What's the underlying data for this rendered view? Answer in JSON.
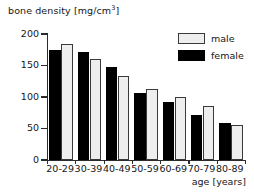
{
  "chart_data": {
    "type": "bar",
    "title": "",
    "xlabel": "age [years]",
    "ylabel": "bone density [mg/cm",
    "ylabel_sup": "3",
    "ylabel_tail": "]",
    "ylabel_full": "bone density [mg/cm3]",
    "categories": [
      "20-29",
      "30-39",
      "40-49",
      "50-59",
      "60-69",
      "70-79",
      "80-89"
    ],
    "series": [
      {
        "name": "female",
        "color": "#000000",
        "values": [
          175,
          172,
          147,
          106,
          92,
          71,
          59
        ]
      },
      {
        "name": "male",
        "color": "#eeeeee",
        "values": [
          184,
          161,
          133,
          113,
          100,
          85,
          56
        ]
      }
    ],
    "yticks": [
      0,
      50,
      100,
      150,
      200
    ],
    "ylim": [
      0,
      200
    ],
    "grid": false,
    "legend_position": "top-right",
    "legend_entries": [
      "male",
      "female"
    ]
  },
  "legend": {
    "male_label": "male",
    "female_label": "female"
  },
  "axis": {
    "y_title_main": "bone density [mg/cm",
    "y_title_sup": "3",
    "y_title_end": "]",
    "x_title": "age [years]"
  }
}
